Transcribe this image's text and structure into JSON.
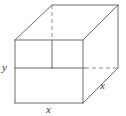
{
  "figure": {
    "type": "geometry-diagram",
    "shape_name": "rectangular-box",
    "width": 126,
    "height": 116,
    "background_color": "#ffffff",
    "line_color": "#6d6d6d",
    "label_color": "#3a3a3a",
    "solid_stroke_width": 1,
    "dashed_stroke_width": 1,
    "dash_pattern": "4 3"
  },
  "labels": {
    "y_left": "y",
    "x_bottom": "x",
    "x_right": "x"
  },
  "geometry": {
    "front_face": {
      "top_left": [
        15,
        40
      ],
      "top_right": [
        83,
        40
      ],
      "bottom_right": [
        83,
        103
      ],
      "bottom_left": [
        15,
        103
      ]
    },
    "back_face": {
      "top_left": [
        52,
        5
      ],
      "top_right": [
        118,
        5
      ],
      "bottom_right": [
        118,
        68
      ],
      "bottom_left": [
        52,
        68
      ]
    },
    "solid_edges": [
      [
        [
          15,
          40
        ],
        [
          83,
          40
        ]
      ],
      [
        [
          83,
          40
        ],
        [
          83,
          103
        ]
      ],
      [
        [
          83,
          103
        ],
        [
          15,
          103
        ]
      ],
      [
        [
          15,
          103
        ],
        [
          15,
          40
        ]
      ],
      [
        [
          52,
          5
        ],
        [
          118,
          5
        ]
      ],
      [
        [
          118,
          5
        ],
        [
          118,
          68
        ]
      ],
      [
        [
          15,
          40
        ],
        [
          52,
          5
        ]
      ],
      [
        [
          83,
          40
        ],
        [
          118,
          5
        ]
      ],
      [
        [
          83,
          103
        ],
        [
          118,
          68
        ]
      ],
      [
        [
          15,
          68
        ],
        [
          52,
          68
        ]
      ],
      [
        [
          52,
          68
        ],
        [
          85,
          68
        ]
      ],
      [
        [
          52,
          40
        ],
        [
          52,
          68
        ]
      ]
    ],
    "dashed_edges": [
      [
        [
          52,
          5
        ],
        [
          52,
          40
        ]
      ],
      [
        [
          85,
          68
        ],
        [
          118,
          68
        ]
      ]
    ]
  }
}
